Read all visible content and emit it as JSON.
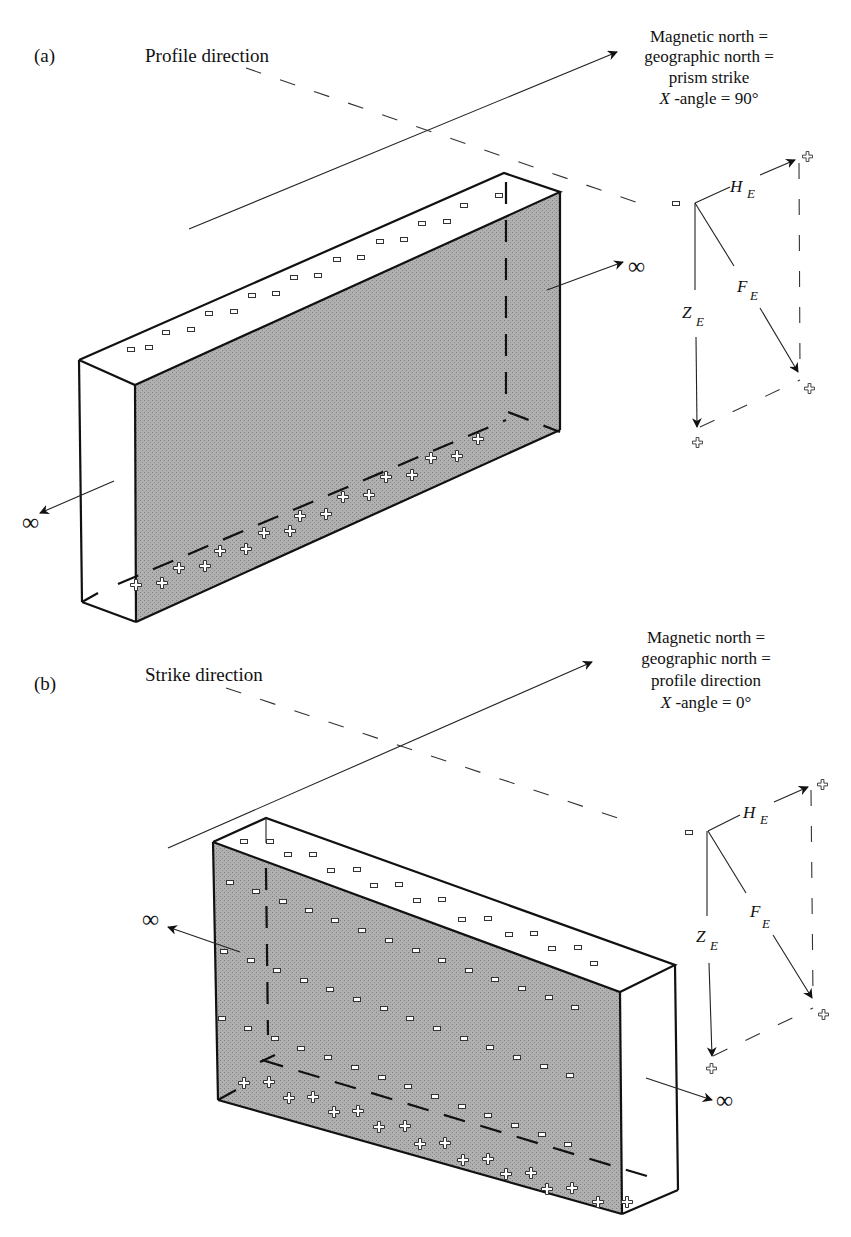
{
  "figure": {
    "panel_a": {
      "panel_label": "(a)",
      "axis_label": "Profile direction",
      "north_caption": {
        "line1": "Magnetic north =",
        "line2": "geographic north =",
        "line3": "prism strike",
        "line4_var": "X",
        "line4_rest": " -angle = 90°"
      },
      "infinity_right": "∞",
      "infinity_left": "∞",
      "vectors": {
        "H": "H",
        "H_sub": "E",
        "F": "F",
        "F_sub": "E",
        "Z": "Z",
        "Z_sub": "E"
      }
    },
    "panel_b": {
      "panel_label": "(b)",
      "axis_label": "Strike direction",
      "north_caption": {
        "line1": "Magnetic north =",
        "line2": "geographic north =",
        "line3": "profile direction",
        "line4_var": "X",
        "line4_rest": " -angle = 0°"
      },
      "infinity_left": "∞",
      "infinity_right": "∞",
      "vectors": {
        "H": "H",
        "H_sub": "E",
        "F": "F",
        "F_sub": "E",
        "Z": "Z",
        "Z_sub": "E"
      }
    },
    "colors": {
      "shaded_face": "#a9a9a9",
      "line": "#111111",
      "background": "#ffffff"
    }
  }
}
